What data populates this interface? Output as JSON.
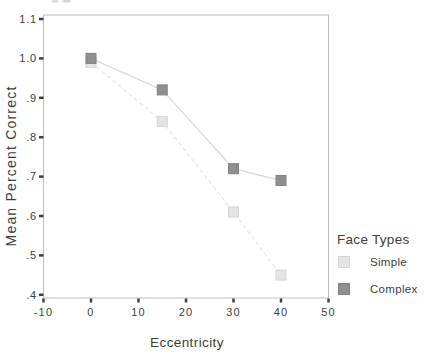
{
  "chart_data": {
    "type": "line",
    "title": "",
    "xlabel": "Eccentricity",
    "ylabel": "Mean Percent Correct",
    "x": [
      0,
      15,
      30,
      40
    ],
    "series": [
      {
        "name": "Simple",
        "values": [
          0.99,
          0.84,
          0.61,
          0.45
        ],
        "marker": "square",
        "marker_color": "#e4e4e4",
        "marker_edge": "#d4d4d4",
        "line_color": "#e7e7e7",
        "line_style": "dashed"
      },
      {
        "name": "Complex",
        "values": [
          1.0,
          0.92,
          0.72,
          0.69
        ],
        "marker": "square",
        "marker_color": "#8f8f8f",
        "marker_edge": "#828282",
        "line_color": "#d8d8d8",
        "line_style": "solid"
      }
    ],
    "x_tick_labels": [
      "-10",
      "0",
      "10",
      "20",
      "30",
      "40",
      "50"
    ],
    "x_tick_values": [
      -10,
      0,
      10,
      20,
      30,
      40,
      50
    ],
    "y_tick_labels": [
      "1.1",
      "1.0",
      ".9",
      ".8",
      ".7",
      ".6",
      ".5",
      ".4"
    ],
    "y_tick_values": [
      1.1,
      1.0,
      0.9,
      0.8,
      0.7,
      0.6,
      0.5,
      0.4
    ],
    "xlim": [
      -10,
      50
    ],
    "ylim": [
      0.4,
      1.1
    ],
    "grid": false,
    "legend": {
      "title": "Face Types",
      "position": "right",
      "entries": [
        "Simple",
        "Complex"
      ]
    }
  },
  "colors": {
    "background": "#ffffff",
    "frame": "#bdbdbd",
    "tick_mark": "#404040",
    "text": "#3d3d3d"
  }
}
